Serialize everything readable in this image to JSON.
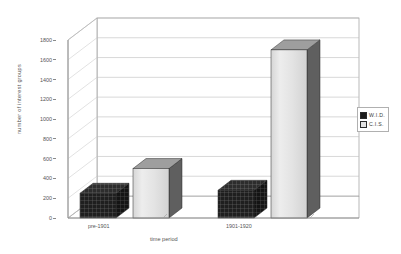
{
  "chart_data": {
    "type": "bar",
    "title": "",
    "xlabel": "time period",
    "ylabel": "number of interest groups",
    "categories": [
      "pre-1901",
      "1901-1920"
    ],
    "series": [
      {
        "name": "W.I.D.",
        "values": [
          250,
          280
        ],
        "color": "#1c1c1c"
      },
      {
        "name": "C.I.S.",
        "values": [
          500,
          1700
        ],
        "color": "#e2e2e2"
      }
    ],
    "ylim": [
      0,
      1800
    ],
    "ytick_labels": [
      "0",
      "200",
      "400",
      "600",
      "800",
      "1000",
      "1200",
      "1400",
      "1600",
      "1800"
    ],
    "ytick_values": [
      0,
      200,
      400,
      600,
      800,
      1000,
      1200,
      1400,
      1600,
      1800
    ],
    "grid": true,
    "three_d": true,
    "legend_position": "right",
    "legend_entries": [
      "W.I.D.",
      "C.I.S."
    ]
  },
  "legend": {
    "wid_label": "W.I.D.",
    "cis_label": "C.I.S."
  },
  "axes": {
    "x_title": "time period",
    "y_title": "number of interest groups",
    "x_cat_0": "pre-1901",
    "x_cat_1": "1901-1920"
  },
  "colors": {
    "series_wid": "#1c1c1c",
    "series_cis": "#e2e2e2",
    "gridline": "#b9b9b9",
    "axis": "#8a8a8a",
    "background": "#ffffff"
  }
}
